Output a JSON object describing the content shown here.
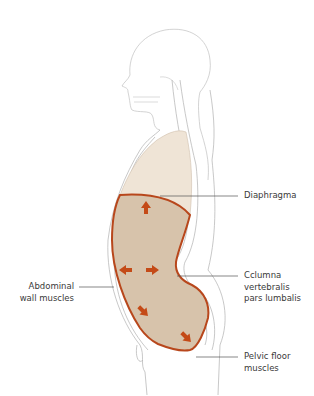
{
  "figure": {
    "type": "anatomical-diagram"
  },
  "labels": {
    "diaphragma": {
      "lines": [
        "Diaphragma"
      ]
    },
    "columna": {
      "lines": [
        "Cclumna",
        "vertebralis",
        "pars lumbalis"
      ]
    },
    "abdominal": {
      "lines": [
        "Abdominal",
        "wall muscles"
      ]
    },
    "pelvic": {
      "lines": [
        "Pelvic floor",
        "muscles"
      ]
    }
  },
  "arrows": [
    {
      "direction": "up"
    },
    {
      "direction": "left"
    },
    {
      "direction": "right"
    },
    {
      "direction": "down-left"
    },
    {
      "direction": "down-right"
    }
  ],
  "colors": {
    "outline": "#b5b5b5",
    "thorax_fill": "#efe4d6",
    "abdomen_fill": "#d7c3ab",
    "muscle_border": "#b8471c",
    "arrow": "#c44a17",
    "leader": "#555555",
    "text": "#3a3a3a"
  }
}
